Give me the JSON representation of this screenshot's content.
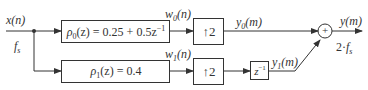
{
  "diagram": {
    "input": {
      "label": "x(n)",
      "rate": "f",
      "rate_sub": "s"
    },
    "branch0": {
      "filter": "ρ0(z) = 0.25 + 0.5z⁻¹",
      "filter_sym": "ρ",
      "filter_sub": "0",
      "filter_rest": "(z) = 0.25 + 0.5z",
      "filter_sup": "−1",
      "w_label": "w",
      "w_sub": "0",
      "w_arg": "(n)",
      "upsampler": "↑2",
      "y_label": "y",
      "y_sub": "0",
      "y_arg": "(m)"
    },
    "branch1": {
      "filter": "ρ1(z) = 0.4",
      "filter_sym": "ρ",
      "filter_sub": "1",
      "filter_rest": "(z) = 0.4",
      "w_label": "w",
      "w_sub": "1",
      "w_arg": "(n)",
      "upsampler": "↑2",
      "delay": "z",
      "delay_sup": "−1",
      "y_label": "y",
      "y_sub": "1",
      "y_arg": "(m)"
    },
    "adder": "+",
    "output": {
      "label": "y(m)",
      "rate_prefix": "2·",
      "rate": "f",
      "rate_sub": "s"
    },
    "colors": {
      "line": "#333333",
      "background": "#ffffff"
    }
  }
}
